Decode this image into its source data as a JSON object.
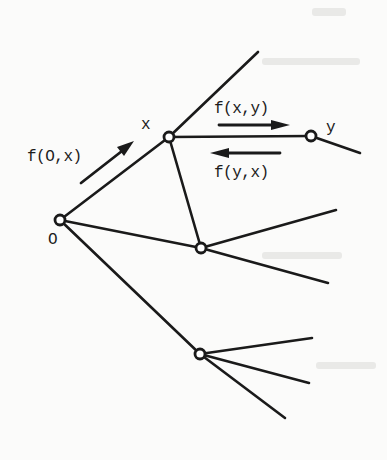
{
  "diagram": {
    "type": "tree-graph",
    "colors": {
      "ink": "#1a1a1a",
      "paper": "#fbfbfa"
    },
    "nodes": [
      {
        "id": "O",
        "label": "O",
        "x": 60,
        "y": 220
      },
      {
        "id": "X",
        "label": "x",
        "x": 169,
        "y": 137
      },
      {
        "id": "Y",
        "label": "y",
        "x": 311,
        "y": 136
      },
      {
        "id": "M",
        "label": "",
        "x": 201,
        "y": 248
      },
      {
        "id": "L",
        "label": "",
        "x": 200,
        "y": 354
      }
    ],
    "edges": [
      {
        "from": "O",
        "to": "X"
      },
      {
        "from": "O",
        "to": "M"
      },
      {
        "from": "O",
        "to": "L"
      },
      {
        "from": "X",
        "to": "Y"
      },
      {
        "from": "X",
        "to": "M"
      },
      {
        "from": "X",
        "to_point": [
          258,
          52
        ]
      },
      {
        "from": "Y",
        "to_point": [
          360,
          153
        ]
      },
      {
        "from": "M",
        "to_point": [
          336,
          210
        ]
      },
      {
        "from": "M",
        "to_point": [
          328,
          283
        ]
      },
      {
        "from": "L",
        "to_point": [
          312,
          338
        ]
      },
      {
        "from": "L",
        "to_point": [
          309,
          383
        ]
      },
      {
        "from": "L",
        "to_point": [
          285,
          418
        ]
      }
    ],
    "flows": [
      {
        "id": "f_0_x",
        "label": "f(O,x)",
        "direction": "O→x"
      },
      {
        "id": "f_x_y",
        "label": "f(x,y)",
        "direction": "x→y"
      },
      {
        "id": "f_y_x",
        "label": "f(y,x)",
        "direction": "y→x"
      }
    ],
    "labels": {
      "node_O": "O",
      "node_x": "x",
      "node_y": "y",
      "flow_0_x": "f(O,x)",
      "flow_x_y": "f(x,y)",
      "flow_y_x": "f(y,x)"
    }
  }
}
